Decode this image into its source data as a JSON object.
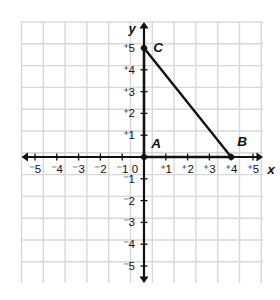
{
  "figure": {
    "title": "",
    "background_color": "#ffffff",
    "grid_color": "#d8d8d8",
    "axis_color": "#111111",
    "shape_color": "#111111",
    "label_color": "#111111"
  },
  "axes": {
    "x_label": "x",
    "y_label": "y",
    "origin_label": "0",
    "x_ticks": [
      {
        "value": -5,
        "label": "⁻5"
      },
      {
        "value": -4,
        "label": "⁻4"
      },
      {
        "value": -3,
        "label": "⁻3"
      },
      {
        "value": -2,
        "label": "⁻2"
      },
      {
        "value": -1,
        "label": "⁻1"
      },
      {
        "value": 1,
        "label": "⁺1"
      },
      {
        "value": 2,
        "label": "⁺2"
      },
      {
        "value": 3,
        "label": "⁺3"
      },
      {
        "value": 4,
        "label": "⁺4"
      },
      {
        "value": 5,
        "label": "⁺5"
      }
    ],
    "y_ticks": [
      {
        "value": 5,
        "label": "⁺5"
      },
      {
        "value": 4,
        "label": "⁺4"
      },
      {
        "value": 3,
        "label": "⁺3"
      },
      {
        "value": 2,
        "label": "⁺2"
      },
      {
        "value": 1,
        "label": "⁺1"
      },
      {
        "value": -1,
        "label": "⁻1"
      },
      {
        "value": -2,
        "label": "⁻2"
      },
      {
        "value": -3,
        "label": "⁻3"
      },
      {
        "value": -4,
        "label": "⁻4"
      },
      {
        "value": -5,
        "label": "⁻5"
      }
    ]
  },
  "chart_data": {
    "type": "scatter",
    "title": "",
    "xlabel": "x",
    "ylabel": "y",
    "xlim": [
      -5.6,
      5.5
    ],
    "ylim": [
      -6.2,
      6.2
    ],
    "grid": true,
    "legend": "none",
    "points": [
      {
        "name": "A",
        "x": 0,
        "y": 0,
        "label": "A",
        "label_position": "upper-right"
      },
      {
        "name": "B",
        "x": 4,
        "y": 0,
        "label": "B",
        "label_position": "upper-right"
      },
      {
        "name": "C",
        "x": 0,
        "y": 5,
        "label": "C",
        "label_position": "upper-right"
      }
    ],
    "shapes": [
      {
        "type": "triangle",
        "name": "triangle-ABC",
        "vertices": [
          {
            "name": "A",
            "x": 0,
            "y": 0
          },
          {
            "name": "B",
            "x": 4,
            "y": 0
          },
          {
            "name": "C",
            "x": 0,
            "y": 5
          }
        ],
        "closed": true,
        "filled": false
      }
    ]
  }
}
